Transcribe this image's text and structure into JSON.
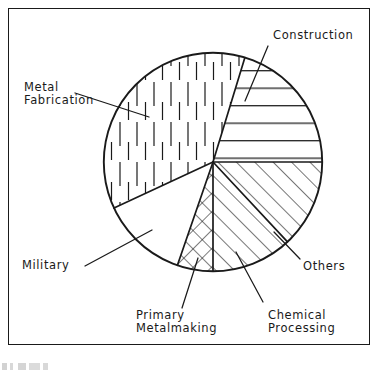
{
  "figure": {
    "title": "",
    "frame_visible": true,
    "border_color": "#1a1a1a",
    "background_color": "#ffffff"
  },
  "labels": {
    "construction": "Construction",
    "metal_fabrication_line1": "Metal",
    "metal_fabrication_line2": "Fabrication",
    "military": "Military",
    "primary_metalmaking_line1": "Primary",
    "primary_metalmaking_line2": "Metalmaking",
    "chemical_processing_line1": "Chemical",
    "chemical_processing_line2": "Processing",
    "others": "Others"
  },
  "chart_data": {
    "type": "pie",
    "title": "",
    "xlabel": "",
    "ylabel": "",
    "legend_position": "none",
    "grid": false,
    "units": "percent",
    "center": {
      "x": 213,
      "y": 162
    },
    "radius": 110,
    "start_angle_deg": -73,
    "direction": "clockwise",
    "labels": [
      "Construction",
      "Others",
      "Chemical Processing",
      "Primary Metalmaking",
      "Military",
      "Metal Fabrication"
    ],
    "values": [
      20.3,
      13.1,
      11.9,
      5.3,
      12.8,
      36.6
    ],
    "angles_deg": [
      73,
      47,
      43,
      19,
      46,
      132
    ],
    "slices": [
      {
        "name": "Construction",
        "value": 20.3,
        "angle_deg": 73,
        "start_deg": -73,
        "end_deg": 0,
        "fill": "horizontal-lines"
      },
      {
        "name": "Others",
        "value": 13.1,
        "angle_deg": 47,
        "start_deg": 0,
        "end_deg": 47,
        "fill": "diagonal-lines-right"
      },
      {
        "name": "Chemical Processing",
        "value": 11.9,
        "angle_deg": 43,
        "start_deg": 47,
        "end_deg": 90,
        "fill": "diagonal-lines-right"
      },
      {
        "name": "Primary Metalmaking",
        "value": 5.3,
        "angle_deg": 19,
        "start_deg": 90,
        "end_deg": 109,
        "fill": "crosshatch"
      },
      {
        "name": "Military",
        "value": 12.8,
        "angle_deg": 46,
        "start_deg": 109,
        "end_deg": 155,
        "fill": "blank"
      },
      {
        "name": "Metal Fabrication",
        "value": 36.6,
        "angle_deg": 132,
        "start_deg": 155,
        "end_deg": 287,
        "fill": "vertical-dashes"
      }
    ]
  }
}
